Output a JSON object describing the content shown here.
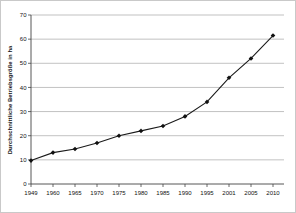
{
  "window": {
    "background": "#ffffff",
    "border_color": "#c9c9c9"
  },
  "chart_data": {
    "type": "line",
    "title": "",
    "categories": [
      "1949",
      "1960",
      "1965",
      "1970",
      "1975",
      "1980",
      "1985",
      "1990",
      "1995",
      "2001",
      "2005",
      "2010"
    ],
    "series": [
      {
        "name": "Durchschnittliche Betriebsgröße in ha",
        "values": [
          9.7,
          13,
          14.5,
          17,
          20,
          22,
          24,
          28,
          34,
          44,
          52,
          61.5
        ]
      }
    ],
    "xlabel": "",
    "ylabel": "Durchschnittliche Betriebsgröße in ha",
    "ylim": [
      0,
      70
    ],
    "ytick_step": 10,
    "yticks": [
      0,
      10,
      20,
      30,
      40,
      50,
      60,
      70
    ],
    "grid": "horizontal",
    "legend": "none",
    "line_color": "#1a1a1a",
    "marker": "diamond",
    "marker_color": "#111111",
    "gridline_color": "#a6a6a6",
    "axis_color": "#444444",
    "tick_label_color": "#111111"
  }
}
